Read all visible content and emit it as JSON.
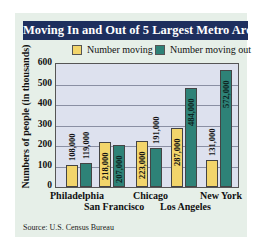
{
  "chart_data": {
    "type": "bar",
    "title": "Moving In and Out of 5 Largest Metro Areas",
    "categories": [
      "Philadelphia",
      "San Francisco",
      "Chicago",
      "Los Angeles",
      "New York"
    ],
    "series": [
      {
        "name": "Number moving in",
        "color": "#f2d56b",
        "values": [
          108000,
          218000,
          223000,
          287000,
          131000
        ],
        "labels": [
          "108,000",
          "218,000",
          "223,000",
          "287,000",
          "131,000"
        ]
      },
      {
        "name": "Number moving out",
        "color": "#2e8277",
        "values": [
          119000,
          207000,
          191000,
          484000,
          572000
        ],
        "labels": [
          "119,000",
          "207,000",
          "191,000",
          "484,000",
          "572,000"
        ]
      }
    ],
    "xlabel": "",
    "ylabel": "Numbers of people (in thousands)",
    "yticks": [
      "0",
      "100",
      "200",
      "300",
      "400",
      "500",
      "600"
    ],
    "ylim": [
      0,
      600
    ],
    "grid": true,
    "legend_position": "top",
    "source": "Source: U.S. Census Bureau"
  }
}
